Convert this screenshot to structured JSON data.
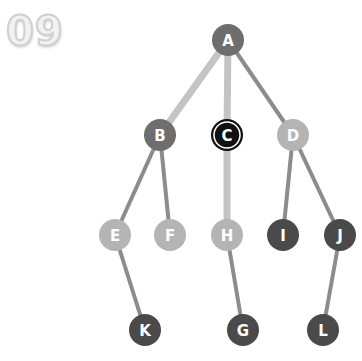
{
  "badge": {
    "text": "09"
  },
  "colors": {
    "dark": "#4a4a4a",
    "mid": "#6e6e6e",
    "light": "#b4b4b4",
    "highlight": "#111111",
    "edge_dark": "#8c8c8c",
    "edge_light": "#c4c4c4"
  },
  "nodes": [
    {
      "id": "A",
      "label": "A",
      "x": 228,
      "y": 40,
      "shade": "mid"
    },
    {
      "id": "B",
      "label": "B",
      "x": 160,
      "y": 135,
      "shade": "mid"
    },
    {
      "id": "C",
      "label": "C",
      "x": 227,
      "y": 135,
      "shade": "highlight"
    },
    {
      "id": "D",
      "label": "D",
      "x": 293,
      "y": 135,
      "shade": "light"
    },
    {
      "id": "E",
      "label": "E",
      "x": 115,
      "y": 235,
      "shade": "light"
    },
    {
      "id": "F",
      "label": "F",
      "x": 170,
      "y": 235,
      "shade": "light"
    },
    {
      "id": "H",
      "label": "H",
      "x": 227,
      "y": 235,
      "shade": "light"
    },
    {
      "id": "I",
      "label": "I",
      "x": 283,
      "y": 235,
      "shade": "dark"
    },
    {
      "id": "J",
      "label": "J",
      "x": 340,
      "y": 235,
      "shade": "dark"
    },
    {
      "id": "K",
      "label": "K",
      "x": 145,
      "y": 330,
      "shade": "dark"
    },
    {
      "id": "G",
      "label": "G",
      "x": 243,
      "y": 330,
      "shade": "dark"
    },
    {
      "id": "L",
      "label": "L",
      "x": 323,
      "y": 330,
      "shade": "dark"
    }
  ],
  "edges": [
    {
      "from": "A",
      "to": "B",
      "width": 7,
      "shade": "edge_light"
    },
    {
      "from": "A",
      "to": "C",
      "width": 7,
      "shade": "edge_light"
    },
    {
      "from": "A",
      "to": "D",
      "width": 4,
      "shade": "edge_dark"
    },
    {
      "from": "B",
      "to": "E",
      "width": 4,
      "shade": "edge_dark"
    },
    {
      "from": "B",
      "to": "F",
      "width": 4,
      "shade": "edge_dark"
    },
    {
      "from": "C",
      "to": "H",
      "width": 7,
      "shade": "edge_light"
    },
    {
      "from": "D",
      "to": "I",
      "width": 4,
      "shade": "edge_dark"
    },
    {
      "from": "D",
      "to": "J",
      "width": 4,
      "shade": "edge_dark"
    },
    {
      "from": "E",
      "to": "K",
      "width": 4,
      "shade": "edge_dark"
    },
    {
      "from": "H",
      "to": "G",
      "width": 4,
      "shade": "edge_dark"
    },
    {
      "from": "J",
      "to": "L",
      "width": 4,
      "shade": "edge_dark"
    }
  ],
  "node_radius": 16
}
